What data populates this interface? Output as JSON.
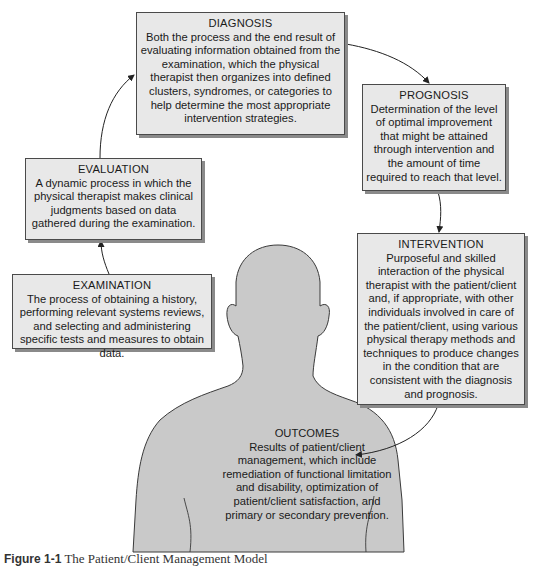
{
  "diagram": {
    "title": "The Patient/Client Management Model",
    "colors": {
      "box_fill": "#e8e8e8",
      "box_border": "#4a4a4a",
      "box_shadow": "#8a8a8a",
      "silhouette_fill": "#c9c9c9",
      "silhouette_outline": "#3a3a3a",
      "arrow": "#222222"
    },
    "nodes": {
      "diagnosis": {
        "title": "DIAGNOSIS",
        "body": "Both the process and the end result of evaluating information obtained from the examination, which the physical therapist then organizes into defined clusters, syndromes, or categories to help determine the most appropriate intervention strategies."
      },
      "prognosis": {
        "title": "PROGNOSIS",
        "body": "Determination of the level of optimal improvement that might be attained through intervention and the amount of time required to reach that level."
      },
      "evaluation": {
        "title": "EVALUATION",
        "body": "A dynamic process in which the physical therapist makes clinical judgments based on data gathered during the examination."
      },
      "examination": {
        "title": "EXAMINATION",
        "body": "The process of obtaining a history, performing relevant systems reviews, and selecting and administering specific tests and measures to obtain data."
      },
      "intervention": {
        "title": "INTERVENTION",
        "body": "Purposeful and skilled interaction of the physical therapist with the patient/client and, if appropriate, with other individuals involved in care of the patient/client, using various physical therapy methods and techniques to produce changes in the condition that are consistent with the diagnosis and prognosis."
      },
      "outcomes": {
        "title": "OUTCOMES",
        "body": "Results of patient/client management, which include remediation of functional limitation and disability, optimization of patient/client satisfaction, and primary or secondary prevention."
      }
    },
    "edges": [
      {
        "from": "examination",
        "to": "evaluation"
      },
      {
        "from": "evaluation",
        "to": "diagnosis"
      },
      {
        "from": "diagnosis",
        "to": "prognosis"
      },
      {
        "from": "prognosis",
        "to": "intervention"
      },
      {
        "from": "intervention",
        "to": "outcomes"
      }
    ],
    "caption": {
      "label": "Figure 1-1",
      "text": "The Patient/Client Management Model"
    }
  }
}
